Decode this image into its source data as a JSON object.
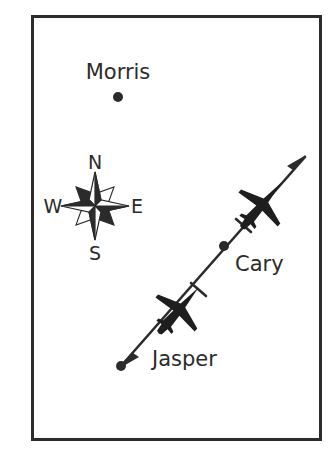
{
  "figure": {
    "type": "map-diagram",
    "title": "",
    "background_color": "#ffffff",
    "ink_color": "#2b2b2b",
    "frame": {
      "name": "map-border",
      "x": 31,
      "y": 15,
      "width": 291,
      "height": 426,
      "stroke_color": "#2b2b2b",
      "stroke_width": 3
    }
  },
  "compass_rose": {
    "center_x": 95,
    "center_y": 206,
    "labels": {
      "north": "N",
      "west": "W",
      "east": "E",
      "south": "S"
    },
    "points": 8,
    "color": "#2b2b2b"
  },
  "places": [
    {
      "name": "Morris",
      "label": "Morris",
      "label_x": 118,
      "label_y": 79,
      "marker_x": 118,
      "marker_y": 97,
      "marker_radius": 5,
      "on_path": false
    },
    {
      "name": "Cary",
      "label": "Cary",
      "label_x": 235,
      "label_y": 271,
      "marker_x": 224,
      "marker_y": 246,
      "marker_radius": 5,
      "on_path": true
    },
    {
      "name": "Jasper",
      "label": "Jasper",
      "label_x": 152,
      "label_y": 366,
      "marker_x": 121,
      "marker_y": 366,
      "marker_radius": 5,
      "on_path": true
    }
  ],
  "flight_path": {
    "name": "flight-path",
    "start_x": 121,
    "start_y": 366,
    "end_x": 305,
    "end_y": 157,
    "stroke_color": "#2b2b2b",
    "stroke_width": 2.6,
    "arrowheads": "both",
    "aircraft": [
      {
        "name": "aircraft-upper",
        "x": 262,
        "y": 205,
        "scale": 1.0
      },
      {
        "name": "aircraft-lower",
        "x": 179,
        "y": 310,
        "scale": 1.0
      }
    ],
    "tick_marks": [
      {
        "name": "tick-upper",
        "x": 243,
        "y": 226
      },
      {
        "name": "tick-lower",
        "x": 198,
        "y": 290
      }
    ]
  }
}
